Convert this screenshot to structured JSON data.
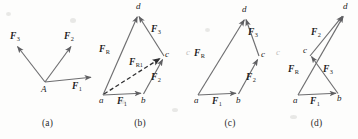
{
  "figure": {
    "kind": "vector-force-diagrams",
    "background_color": "#fdfdfc",
    "stroke_color": "#6e6e70",
    "label_color": "#232323",
    "panels": [
      {
        "id": "a",
        "caption": "(a)",
        "origin_point": "A",
        "vectors": [
          {
            "label": "F",
            "sub": "1",
            "from": [
              45,
              82
            ],
            "to": [
              93,
              77
            ]
          },
          {
            "label": "F",
            "sub": "2",
            "from": [
              45,
              82
            ],
            "to": [
              72,
              45
            ]
          },
          {
            "label": "F",
            "sub": "3",
            "from": [
              45,
              82
            ],
            "to": [
              16,
              45
            ]
          }
        ],
        "points": [
          {
            "name": "A",
            "x": 45,
            "y": 82
          }
        ]
      },
      {
        "id": "b",
        "caption": "(b)",
        "vectors": [
          {
            "label": "F",
            "sub": "1",
            "from": [
              103,
              95
            ],
            "to": [
              143,
              93
            ]
          },
          {
            "label": "F",
            "sub": "2",
            "from": [
              143,
              94
            ],
            "to": [
              164,
              57
            ]
          },
          {
            "label": "F",
            "sub": "3",
            "from": [
              164,
              57
            ],
            "to": [
              138,
              14
            ]
          },
          {
            "label": "F",
            "sub": "R",
            "from": [
              103,
              95
            ],
            "to": [
              138,
              14
            ]
          },
          {
            "label": "F",
            "sub": "R1",
            "from": [
              103,
              95
            ],
            "to": [
              163,
              57
            ],
            "style": "dashed"
          }
        ],
        "points": [
          {
            "name": "a",
            "x": 103,
            "y": 95
          },
          {
            "name": "b",
            "x": 143,
            "y": 94
          },
          {
            "name": "c",
            "x": 164,
            "y": 57
          },
          {
            "name": "d",
            "x": 138,
            "y": 14
          }
        ]
      },
      {
        "id": "c",
        "caption": "(c)",
        "vectors": [
          {
            "label": "F",
            "sub": "1",
            "from": [
              198,
              95
            ],
            "to": [
              238,
              93
            ]
          },
          {
            "label": "F",
            "sub": "2",
            "from": [
              238,
              94
            ],
            "to": [
              259,
              57
            ]
          },
          {
            "label": "F",
            "sub": "3",
            "from": [
              259,
              57
            ],
            "to": [
              245,
              17
            ]
          },
          {
            "label": "F",
            "sub": "R",
            "from": [
              198,
              95
            ],
            "to": [
              245,
              17
            ]
          }
        ],
        "points": [
          {
            "name": "a",
            "x": 198,
            "y": 95
          },
          {
            "name": "b",
            "x": 238,
            "y": 94
          },
          {
            "name": "c",
            "x": 259,
            "y": 57
          },
          {
            "name": "d",
            "x": 245,
            "y": 17
          }
        ]
      },
      {
        "id": "d",
        "caption": "(d)",
        "vectors": [
          {
            "label": "F",
            "sub": "1",
            "from": [
              298,
              95
            ],
            "to": [
              338,
              93
            ]
          },
          {
            "label": "F",
            "sub": "3",
            "from": [
              338,
              94
            ],
            "to": [
              310,
              55
            ]
          },
          {
            "label": "F",
            "sub": "2",
            "from": [
              310,
              56
            ],
            "to": [
              344,
              14
            ]
          },
          {
            "label": "F",
            "sub": "R",
            "from": [
              298,
              95
            ],
            "to": [
              344,
              14
            ]
          }
        ],
        "points": [
          {
            "name": "a",
            "x": 298,
            "y": 95
          },
          {
            "name": "b",
            "x": 338,
            "y": 93
          },
          {
            "name": "c",
            "x": 309,
            "y": 53
          },
          {
            "name": "d",
            "x": 344,
            "y": 14
          }
        ]
      }
    ],
    "labels": {
      "F1": "F",
      "F2": "F",
      "F3": "F",
      "FR": "F",
      "FR1": "F",
      "sub1": "1",
      "sub2": "2",
      "sub3": "3",
      "subR": "R",
      "subR1": "R1",
      "pointA": "A",
      "pointa": "a",
      "pointb": "b",
      "pointc": "c",
      "pointd": "d"
    },
    "captions": {
      "a": "(a)",
      "b": "(b)",
      "c": "(c)",
      "d": "(d)"
    },
    "artifacts": {
      "ghost_c_left": "c",
      "ghost_c_right": "c"
    }
  }
}
